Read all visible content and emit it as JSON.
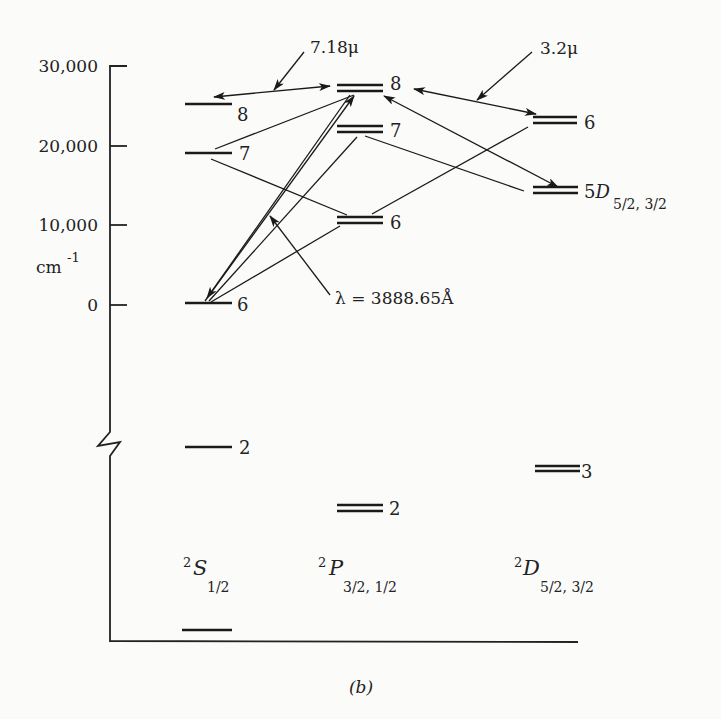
{
  "figure": {
    "caption": "(b)",
    "y_axis": {
      "unit_label": "cm",
      "unit_exponent": "-1",
      "ticks": [
        {
          "label": "30,000",
          "value": 30000,
          "y": 66
        },
        {
          "label": "20,000",
          "value": 20000,
          "y": 146
        },
        {
          "label": "10,000",
          "value": 10000,
          "y": 225
        },
        {
          "label": "0",
          "value": 0,
          "y": 305
        }
      ],
      "has_axis_break": true
    },
    "columns": [
      {
        "id": "S",
        "term": "S",
        "multiplicity": "2",
        "j_values": "1/2"
      },
      {
        "id": "P",
        "term": "P",
        "multiplicity": "2",
        "j_values": "3/2, 1/2"
      },
      {
        "id": "D",
        "term": "D",
        "multiplicity": "2",
        "j_values": "5/2, 3/2"
      }
    ],
    "levels": {
      "S": [
        {
          "n": "8",
          "energy_cm1": 25700
        },
        {
          "n": "7",
          "energy_cm1": 19000
        },
        {
          "n": "6",
          "energy_cm1": 0
        },
        {
          "n": "2",
          "energy_cm1": null
        },
        {
          "n": "",
          "energy_cm1": null
        }
      ],
      "P": [
        {
          "n": "8",
          "energy_cm1": 27700
        },
        {
          "n": "7",
          "energy_cm1": 22500
        },
        {
          "n": "6",
          "energy_cm1": 11400
        },
        {
          "n": "2",
          "energy_cm1": null
        }
      ],
      "D": [
        {
          "n": "6",
          "energy_cm1": 23400
        },
        {
          "n": "5D",
          "sub": "5/2, 3/2",
          "energy_cm1": 14600
        },
        {
          "n": "3",
          "energy_cm1": null
        }
      ]
    },
    "annotations": {
      "ir1": "7.18μ",
      "ir2": "3.2μ",
      "uv": "λ = 3888.65Å"
    }
  }
}
